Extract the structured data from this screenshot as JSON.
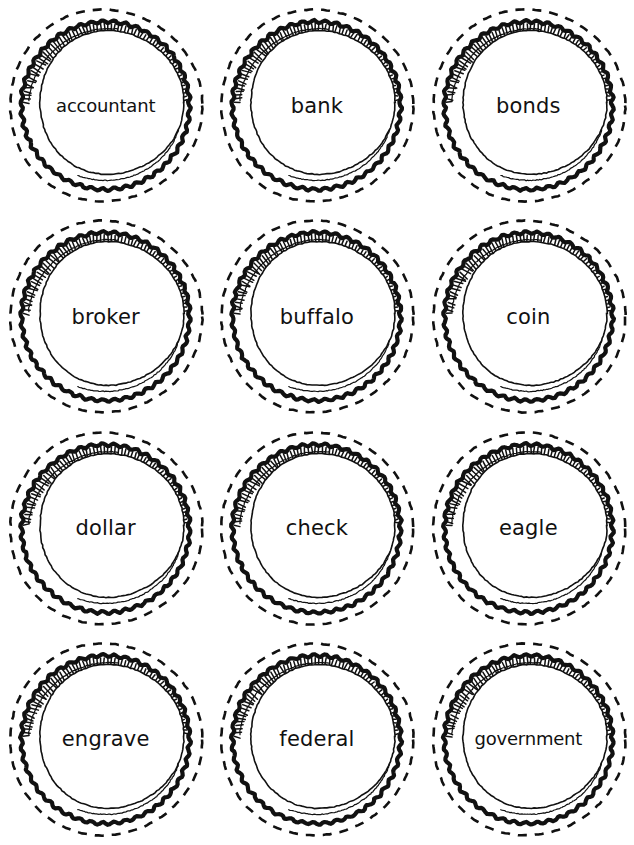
{
  "sheet": {
    "title": "Money Vocabulary Coin Cut-Outs",
    "background_color": "#ffffff",
    "ink_color": "#111111",
    "columns": 3,
    "rows": 4
  },
  "cards": [
    {
      "label": "accountant",
      "row": 1,
      "col": 1,
      "size": "tiny"
    },
    {
      "label": "bank",
      "row": 1,
      "col": 2,
      "size": "normal"
    },
    {
      "label": "bonds",
      "row": 1,
      "col": 3,
      "size": "normal"
    },
    {
      "label": "broker",
      "row": 2,
      "col": 1,
      "size": "normal"
    },
    {
      "label": "buffalo",
      "row": 2,
      "col": 2,
      "size": "normal"
    },
    {
      "label": "coin",
      "row": 2,
      "col": 3,
      "size": "normal"
    },
    {
      "label": "dollar",
      "row": 3,
      "col": 1,
      "size": "normal"
    },
    {
      "label": "check",
      "row": 3,
      "col": 2,
      "size": "normal"
    },
    {
      "label": "eagle",
      "row": 3,
      "col": 3,
      "size": "normal"
    },
    {
      "label": "engrave",
      "row": 4,
      "col": 1,
      "size": "normal"
    },
    {
      "label": "federal",
      "row": 4,
      "col": 2,
      "size": "normal"
    },
    {
      "label": "government",
      "row": 4,
      "col": 3,
      "size": "tiny"
    }
  ]
}
